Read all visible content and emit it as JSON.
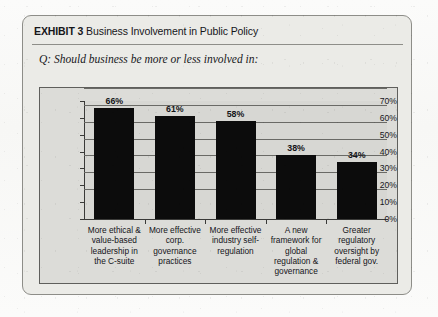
{
  "exhibit": {
    "label": "EXHIBIT 3",
    "title": "Business Involvement in Public Policy",
    "question": "Q: Should business be more or less involved in:"
  },
  "colors": {
    "bar": "#0c0c0c",
    "plot_background": "#d7d7d3",
    "card_background": "#ebebe7",
    "gridline": "#6a6a66",
    "axis": "#3a3a38",
    "text": "#141418"
  },
  "chart_data": {
    "type": "bar",
    "title": "Business Involvement in Public Policy",
    "subtitle": "Q: Should business be more or less involved in:",
    "categories": [
      "More ethical & value-based leadership in the C-suite",
      "More effective corp. governance practices",
      "More effective industry self-regulation",
      "A new framework for global regulation & governance",
      "Greater regulatory oversight by federal gov."
    ],
    "category_lines": [
      [
        "More ethical &",
        "value-based",
        "leadership in",
        "the C-suite"
      ],
      [
        "More effective",
        "corp.",
        "governance",
        "practices"
      ],
      [
        "More effective",
        "industry self-",
        "regulation"
      ],
      [
        "A new",
        "framework for",
        "global",
        "regulation &",
        "governance"
      ],
      [
        "Greater",
        "regulatory",
        "oversight by",
        "federal gov."
      ]
    ],
    "values": [
      66,
      61,
      58,
      38,
      34
    ],
    "value_labels": [
      "66%",
      "61%",
      "58%",
      "38%",
      "34%"
    ],
    "xlabel": "",
    "ylabel": "",
    "ylim": [
      0,
      70
    ],
    "ytick_values": [
      0,
      10,
      20,
      30,
      40,
      50,
      60,
      70
    ],
    "ytick_labels": [
      "0%",
      "10%",
      "20%",
      "30%",
      "40%",
      "50%",
      "60%",
      "70%"
    ],
    "grid": true,
    "legend": false,
    "series_name": "Percent responding"
  }
}
